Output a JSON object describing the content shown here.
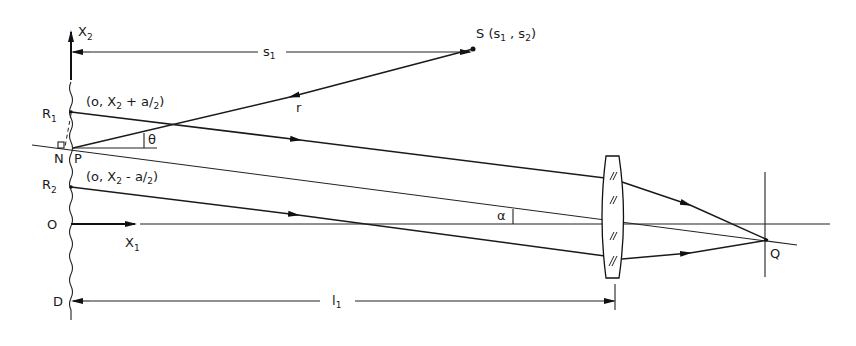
{
  "figure": {
    "type": "optical-ray-diagram",
    "labels": {
      "x2_axis": "X",
      "x2_axis_sub": "2",
      "x1_axis": "X",
      "x1_axis_sub": "1",
      "s1": "s",
      "s1_sub": "1",
      "source": "S (s",
      "source_sub1": "1",
      "source_mid": " , s",
      "source_sub2": "2",
      "source_end": ")",
      "r": "r",
      "R1": "R",
      "R1_sub": "1",
      "R1_coord": "(o, X",
      "R1_coord_sub": "2",
      "R1_coord_tail": " + a/",
      "R1_coord_tail_sub": "2",
      "R1_coord_end": ")",
      "R2": "R",
      "R2_sub": "2",
      "R2_coord": "(o, X",
      "R2_coord_sub": "2",
      "R2_coord_tail": " - a/",
      "R2_coord_tail_sub": "2",
      "R2_coord_end": ")",
      "N": "N",
      "P": "P",
      "theta": "θ",
      "alpha": "α",
      "O": "O",
      "D": "D",
      "l1": "l",
      "l1_sub": "1",
      "Q": "Q"
    },
    "elements": {
      "screen": "wavy vertical surface D",
      "lens": "converging lens with hatch marks",
      "focal_plane": "vertical line through Q"
    }
  }
}
